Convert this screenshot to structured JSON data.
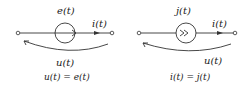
{
  "diagrams": [
    {
      "name": "voltage-source",
      "source_label": "e(t)",
      "current_label": "i(t)",
      "voltage_label": "u(t)",
      "equation": "u(t) = e(t)"
    },
    {
      "name": "current-source",
      "source_label": "j(t)",
      "current_label": "i(t)",
      "voltage_label": "u(t)",
      "equation": "i(t) = j(t)"
    }
  ],
  "colors": {
    "stroke": "#333333",
    "background": "#ffffff"
  }
}
